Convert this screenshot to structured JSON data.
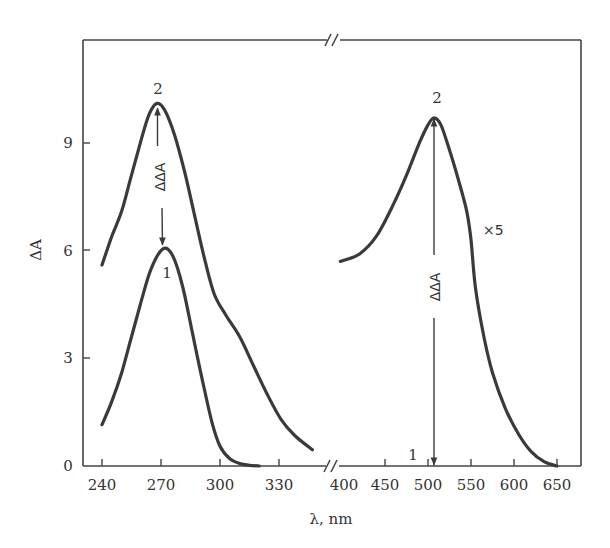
{
  "chart_data": {
    "type": "line",
    "title": "",
    "xlabel": "λ, nm",
    "ylabel": "ΔA",
    "ylim": [
      0,
      11
    ],
    "grid": false,
    "legend": "none (curves labeled inline)",
    "x_axis_break": true,
    "y_ticks": [
      0,
      3,
      6,
      9
    ],
    "panels": [
      {
        "name": "UV region",
        "xlim": [
          235,
          350
        ],
        "x_ticks": [
          240,
          270,
          300,
          330
        ],
        "series": [
          {
            "name": "1",
            "x": [
              240,
              245,
              250,
              255,
              260,
              265,
              271,
              276,
              281,
              286,
              291,
              296,
              300,
              305,
              310,
              315,
              320
            ],
            "y": [
              1.15,
              1.8,
              2.6,
              3.6,
              4.6,
              5.5,
              6.05,
              5.85,
              5.0,
              3.7,
              2.4,
              1.2,
              0.55,
              0.2,
              0.07,
              0.02,
              0.0
            ]
          },
          {
            "name": "2",
            "x": [
              240,
              245,
              250,
              255,
              260,
              264,
              268,
              272,
              277,
              282,
              287,
              292,
              297,
              303,
              310,
              317,
              324,
              331,
              338,
              347
            ],
            "y": [
              5.6,
              6.4,
              7.1,
              8.1,
              9.1,
              9.8,
              10.1,
              9.9,
              9.2,
              8.2,
              7.0,
              5.8,
              4.8,
              4.2,
              3.6,
              2.8,
              2.0,
              1.3,
              0.85,
              0.45
            ]
          }
        ]
      },
      {
        "name": "Visible region",
        "xlim": [
          395,
          677
        ],
        "x_ticks": [
          400,
          450,
          500,
          550,
          600,
          650
        ],
        "series": [
          {
            "name": "2 (×5)",
            "x": [
              398,
              420,
              440,
              460,
              475,
              490,
              500,
              507,
              515,
              525,
              535,
              545,
              550,
              555,
              565,
              575,
              590,
              605,
              620,
              635,
              650
            ],
            "y": [
              5.7,
              5.9,
              6.4,
              7.3,
              8.1,
              9.0,
              9.5,
              9.7,
              9.5,
              8.8,
              8.0,
              7.1,
              6.3,
              5.0,
              3.6,
              2.6,
              1.6,
              0.9,
              0.4,
              0.12,
              0.0
            ]
          }
        ]
      }
    ],
    "annotations": [
      {
        "text": "2",
        "x": 268,
        "y": 10.5,
        "panel": "UV region"
      },
      {
        "text": "1",
        "x": 272,
        "y": 5.3,
        "panel": "UV region"
      },
      {
        "text": "ΔΔA",
        "type": "double-arrow",
        "from": [
          268,
          10.1
        ],
        "to": [
          271,
          6.05
        ],
        "panel": "UV region"
      },
      {
        "text": "2",
        "x": 507,
        "y": 10.2,
        "panel": "Visible region"
      },
      {
        "text": "1",
        "x": 485,
        "y": 0.35,
        "panel": "Visible region"
      },
      {
        "text": "ΔΔA",
        "type": "double-arrow",
        "from": [
          507,
          9.7
        ],
        "to": [
          507,
          0.0
        ],
        "panel": "Visible region"
      },
      {
        "text": "×5",
        "x": 553,
        "y": 6.6,
        "panel": "Visible region"
      }
    ]
  },
  "labels": {
    "xlabel": "λ, nm",
    "ylabel": "ΔA",
    "y_ticks": [
      "0",
      "3",
      "6",
      "9"
    ],
    "x_ticks_left": [
      "240",
      "270",
      "300",
      "330"
    ],
    "x_ticks_right": [
      "400",
      "450",
      "500",
      "550",
      "600",
      "650"
    ],
    "ann_left_peak2": "2",
    "ann_left_peak1": "1",
    "ann_left_ddA": "ΔΔA",
    "ann_right_peak2": "2",
    "ann_right_base1": "1",
    "ann_right_ddA": "ΔΔA",
    "ann_right_scale": "×5"
  },
  "colors": {
    "curve": "#3a3a3a",
    "axis": "#444444",
    "text": "#333333",
    "background": "#ffffff"
  }
}
